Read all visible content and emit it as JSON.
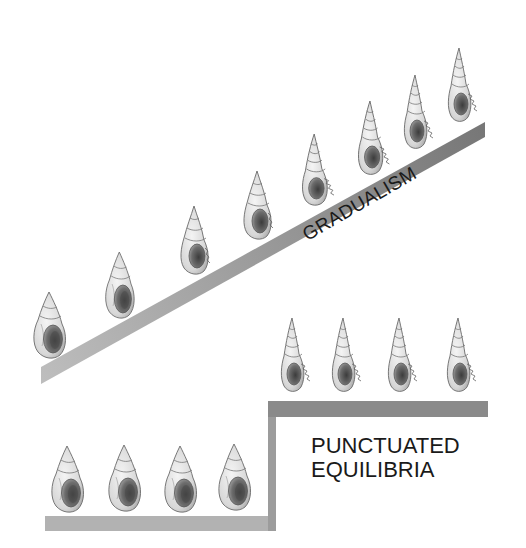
{
  "diagram": {
    "labels": {
      "gradualism": "GRADUALISM",
      "punctuated_line1": "PUNCTUATED",
      "punctuated_line2": "EQUILIBRIA"
    },
    "colors": {
      "background": "#ffffff",
      "band_light": "#b8b8b8",
      "band_dark": "#7c7c7c",
      "step_upper": "#8a8a8a",
      "step_lower": "#b0b0b0",
      "shell_fill": "#e4e4e4",
      "shell_stroke": "#6a6a6a",
      "aperture": "#555555",
      "text": "#1a1a1a"
    },
    "gradualism_series": {
      "shell_count": 8,
      "description": "shells gradually change from squat rounded form to tall slender spired form along a rising slope"
    },
    "punctuated_series": {
      "lower_shell_count": 4,
      "upper_shell_count": 4,
      "description": "rounded shells on a flat lower level, then an abrupt step up to slender spired shells on a flat upper level"
    }
  }
}
